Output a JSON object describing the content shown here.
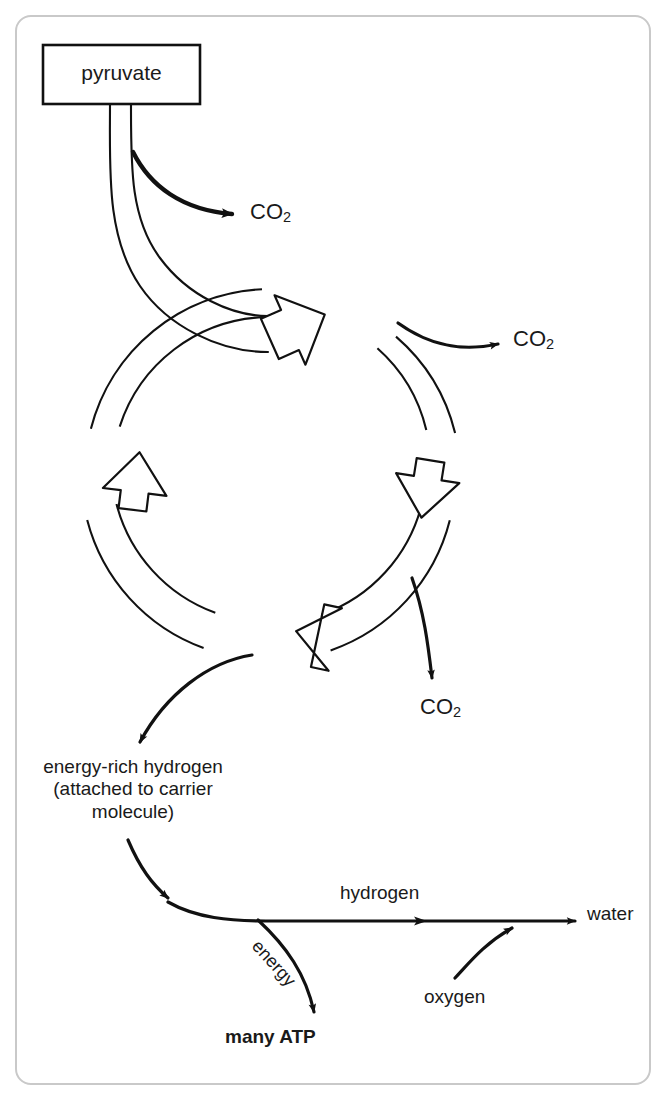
{
  "diagram": {
    "type": "process-flow-cycle",
    "frame": {
      "border_color": "#c9c9c9",
      "background": "#ffffff"
    },
    "ink_color": "#1a1a1a",
    "nodes": {
      "pyruvate": {
        "label": "pyruvate",
        "shape": "rectangle"
      },
      "co2_1": {
        "label": "CO",
        "subscript": "2"
      },
      "co2_2": {
        "label": "CO",
        "subscript": "2"
      },
      "co2_3": {
        "label": "CO",
        "subscript": "2"
      },
      "energy_rich_hydrogen": {
        "line1": "energy-rich hydrogen",
        "line2": "(attached to carrier",
        "line3": "molecule)"
      },
      "hydrogen": {
        "label": "hydrogen"
      },
      "water": {
        "label": "water"
      },
      "oxygen": {
        "label": "oxygen"
      },
      "energy": {
        "label": "energy"
      },
      "many_atp": {
        "label": "many ATP"
      }
    },
    "cycle": {
      "name": "krebs-cycle",
      "direction": "clockwise",
      "center_x": 272,
      "center_y": 475,
      "radius_outer": 186,
      "radius_inner": 158,
      "arrowheads": [
        "top-right",
        "right-down",
        "bottom-left",
        "left-up"
      ]
    }
  }
}
